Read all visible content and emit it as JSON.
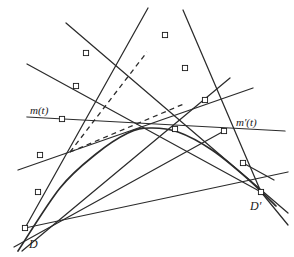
{
  "figure": {
    "type": "geometric-diagram",
    "background_color": "#ffffff",
    "stroke_color": "#2b2b2b",
    "node_fill_color": "#ffffff",
    "node_stroke_color": "#1a1a1a",
    "labels": {
      "m_t": "m(t)",
      "m_prime_t": "m′(t)",
      "D": "D",
      "D_prime": "D′"
    },
    "label_positions": {
      "m_t": {
        "x": 30,
        "y": 105
      },
      "m_prime_t": {
        "x": 236,
        "y": 117
      },
      "D": {
        "x": 29,
        "y": 238
      },
      "D_prime": {
        "x": 250,
        "y": 200
      }
    },
    "nodes": [
      {
        "id": "n1",
        "x": 165,
        "y": 35
      },
      {
        "id": "n2",
        "x": 86,
        "y": 53
      },
      {
        "id": "n3",
        "x": 185,
        "y": 68
      },
      {
        "id": "n4",
        "x": 76,
        "y": 86
      },
      {
        "id": "n5",
        "x": 205,
        "y": 100
      },
      {
        "id": "n6",
        "x": 62,
        "y": 119
      },
      {
        "id": "n7",
        "x": 224,
        "y": 131
      },
      {
        "id": "n8",
        "x": 175,
        "y": 129
      },
      {
        "id": "n9",
        "x": 40,
        "y": 155
      },
      {
        "id": "n10",
        "x": 243,
        "y": 163
      },
      {
        "id": "n11",
        "x": 38,
        "y": 192
      },
      {
        "id": "n12",
        "x": 261,
        "y": 192
      },
      {
        "id": "n13",
        "x": 25,
        "y": 228
      }
    ],
    "solid_lines": [
      {
        "id": "L1",
        "x1": 148,
        "y1": 8,
        "x2": 25,
        "y2": 228,
        "note": "long tangent from top-centre down to D"
      },
      {
        "id": "L2",
        "x1": 183,
        "y1": 10,
        "x2": 261,
        "y2": 192,
        "note": "tangent from top down to D-prime"
      },
      {
        "id": "L3",
        "x1": 27,
        "y1": 64,
        "x2": 261,
        "y2": 192,
        "note": "tangent through n4, n8 toward D-prime"
      },
      {
        "id": "L4",
        "x1": 66,
        "y1": 23,
        "x2": 288,
        "y2": 213,
        "note": "long tangent upper-left to lower-right"
      },
      {
        "id": "L5",
        "x1": 27,
        "y1": 117,
        "x2": 285,
        "y2": 131,
        "note": "m(t) - m-prime(t) near-horizontal chord"
      },
      {
        "id": "L6",
        "x1": 18,
        "y1": 170,
        "x2": 253,
        "y2": 88,
        "note": "tangent lower-left to upper-right"
      },
      {
        "id": "L7",
        "x1": 25,
        "y1": 228,
        "x2": 288,
        "y2": 172,
        "note": "tangent from D sweeping right"
      },
      {
        "id": "L8",
        "x1": 14,
        "y1": 247,
        "x2": 224,
        "y2": 131,
        "note": "tangent through n11 and n7"
      },
      {
        "id": "L9",
        "x1": 230,
        "y1": 78,
        "x2": 22,
        "y2": 251,
        "note": "tangent from right down-left past D"
      },
      {
        "id": "L10",
        "x1": 261,
        "y1": 192,
        "x2": 288,
        "y2": 225,
        "note": "short spur below D-prime"
      },
      {
        "id": "L11",
        "x1": 243,
        "y1": 163,
        "x2": 274,
        "y2": 180,
        "note": "short spur right of node n10"
      }
    ],
    "dashed_lines": [
      {
        "id": "Dsh1",
        "x1": 70,
        "y1": 152,
        "x2": 147,
        "y2": 52,
        "note": "construction line up-right"
      },
      {
        "id": "Dsh2",
        "x1": 70,
        "y1": 152,
        "x2": 186,
        "y2": 103,
        "note": "construction line to the right"
      }
    ],
    "curve": {
      "id": "conic",
      "type": "parabola-arc",
      "points": [
        {
          "x": 18,
          "y": 251
        },
        {
          "x": 60,
          "y": 188
        },
        {
          "x": 96,
          "y": 154
        },
        {
          "x": 128,
          "y": 133
        },
        {
          "x": 150,
          "y": 128
        },
        {
          "x": 178,
          "y": 132
        },
        {
          "x": 212,
          "y": 150
        },
        {
          "x": 248,
          "y": 179
        },
        {
          "x": 276,
          "y": 206
        }
      ],
      "apex": {
        "x": 146,
        "y": 128
      }
    }
  }
}
